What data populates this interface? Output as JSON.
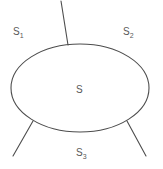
{
  "figure": {
    "type": "geometric-diagram",
    "width": 163,
    "height": 169,
    "background_color": "#ffffff",
    "stroke_color": "#4d4d4d",
    "stroke_width": 1,
    "text_color": "#595959"
  },
  "labels": {
    "region_1": {
      "base": "S",
      "subscript": "1"
    },
    "region_2": {
      "base": "S",
      "subscript": "2"
    },
    "region_3": {
      "base": "S",
      "subscript": "3"
    },
    "surface": {
      "base": "S",
      "subscript": ""
    }
  },
  "geometry": {
    "ellipse": {
      "cx": 80,
      "cy": 88,
      "rx": 69,
      "ry": 44
    },
    "segments": [
      {
        "name": "top-segment",
        "x1": 61,
        "y1": 1,
        "x2": 68,
        "y2": 45
      },
      {
        "name": "bottom-left-segment",
        "x1": 33,
        "y1": 121,
        "x2": 13,
        "y2": 156
      },
      {
        "name": "bottom-right-segment",
        "x1": 127,
        "y1": 121,
        "x2": 146,
        "y2": 156
      }
    ]
  }
}
